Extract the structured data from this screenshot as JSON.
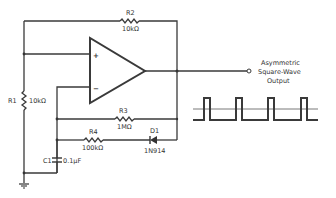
{
  "diagram": {
    "type": "op-amp asymmetric square-wave oscillator schematic",
    "components": {
      "R1": {
        "ref": "R1",
        "value": "10kΩ"
      },
      "R2": {
        "ref": "R2",
        "value": "10kΩ"
      },
      "R3": {
        "ref": "R3",
        "value": "1MΩ"
      },
      "R4": {
        "ref": "R4",
        "value": "100kΩ"
      },
      "C1": {
        "ref": "C1",
        "value": "0.1µF"
      },
      "D1": {
        "ref": "D1",
        "value": "1N914"
      }
    },
    "opamp": {
      "plus": "+",
      "minus": "−"
    },
    "output": {
      "line1": "Asymmetric",
      "line2": "Square-Wave",
      "line3": "Output"
    },
    "waveform": {
      "pulses": 4,
      "shape": "asymmetric-square"
    }
  }
}
